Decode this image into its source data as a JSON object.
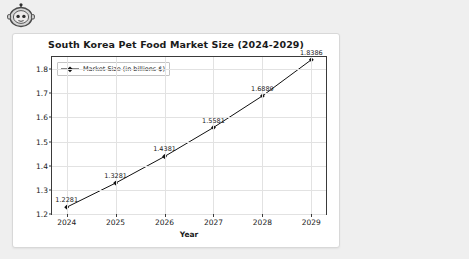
{
  "avatar": {
    "icon": "robot-avatar-icon",
    "alt": "Assistant robot avatar"
  },
  "chart_data": {
    "type": "line",
    "title": "South Korea Pet Food Market Size (2024-2029)",
    "xlabel": "Year",
    "ylabel": "Market Size (in billions $)",
    "categories": [
      "2024",
      "2025",
      "2026",
      "2027",
      "2028",
      "2029"
    ],
    "x": [
      2024,
      2025,
      2026,
      2027,
      2028,
      2029
    ],
    "values": [
      1.2281,
      1.3281,
      1.4381,
      1.5581,
      1.6889,
      1.8386
    ],
    "point_labels": [
      "1.2281",
      "1.3281",
      "1.4381",
      "1.5581",
      "1.6889",
      "1.8386"
    ],
    "series": [
      {
        "name": "Market Size (in billions $)",
        "values": [
          1.2281,
          1.3281,
          1.4381,
          1.5581,
          1.6889,
          1.8386
        ],
        "color": "#111111",
        "marker": "diamond"
      }
    ],
    "legend": {
      "position": "upper-left",
      "entries": [
        "Market Size (in billions $)"
      ]
    },
    "xlim": [
      2023.7,
      2029.3
    ],
    "ylim": [
      1.2,
      1.85
    ],
    "yticks": [
      "1.2",
      "1.3",
      "1.4",
      "1.5",
      "1.6",
      "1.7",
      "1.8"
    ],
    "ytick_values": [
      1.2,
      1.3,
      1.4,
      1.5,
      1.6,
      1.7,
      1.8
    ],
    "xticks": [
      "2024",
      "2025",
      "2026",
      "2027",
      "2028",
      "2029"
    ],
    "grid": true,
    "grid_color": "#e2e2e2"
  },
  "colors": {
    "page_background": "#efefef",
    "card_background": "#ffffff",
    "line": "#111111",
    "axis": "#3a3a3a",
    "text": "#1a1a1a"
  }
}
